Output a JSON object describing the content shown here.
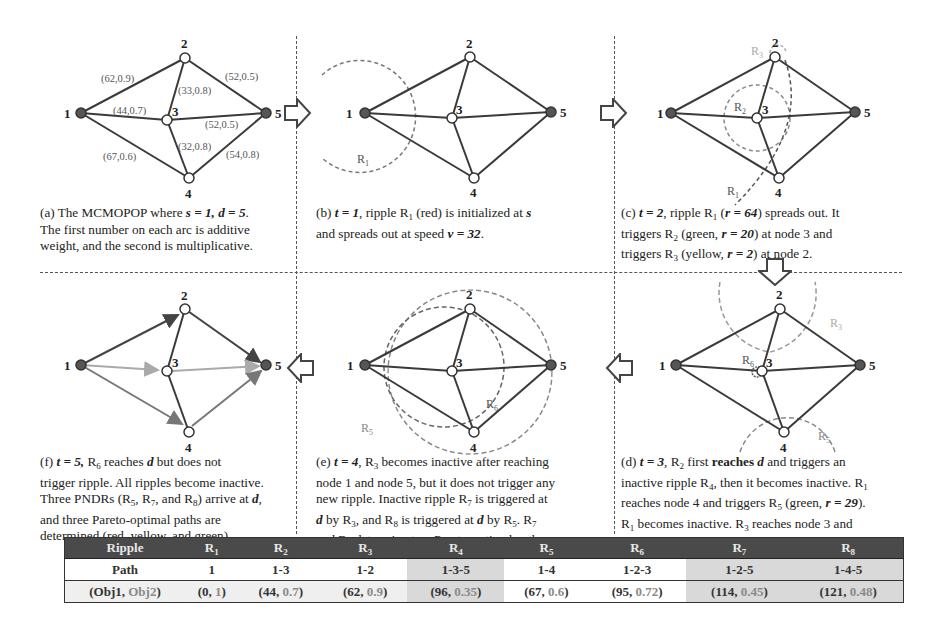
{
  "graph": {
    "nodes": [
      {
        "id": "1",
        "label": "1",
        "role": "source"
      },
      {
        "id": "2",
        "label": "2",
        "role": "intermediate"
      },
      {
        "id": "3",
        "label": "3",
        "role": "intermediate"
      },
      {
        "id": "4",
        "label": "4",
        "role": "intermediate"
      },
      {
        "id": "5",
        "label": "5",
        "role": "destination"
      }
    ],
    "arcs": [
      {
        "from": "1",
        "to": "2",
        "additive": "62",
        "multiplicative": "0.9",
        "label": "(62,0.9)"
      },
      {
        "from": "1",
        "to": "3",
        "additive": "44",
        "multiplicative": "0.7",
        "label": "(44,0.7)"
      },
      {
        "from": "1",
        "to": "4",
        "additive": "67",
        "multiplicative": "0.6",
        "label": "(67,0.6)"
      },
      {
        "from": "2",
        "to": "3",
        "additive": "33",
        "multiplicative": "0.8",
        "label": "(33,0.8)"
      },
      {
        "from": "2",
        "to": "5",
        "additive": "52",
        "multiplicative": "0.5",
        "label": "(52,0.5)"
      },
      {
        "from": "3",
        "to": "5",
        "additive": "52",
        "multiplicative": "0.5",
        "label": "(52,0.5)"
      },
      {
        "from": "3",
        "to": "4",
        "additive": "32",
        "multiplicative": "0.8",
        "label": "(32,0.8)"
      },
      {
        "from": "4",
        "to": "5",
        "additive": "54",
        "multiplicative": "0.8",
        "label": "(54,0.8)"
      }
    ]
  },
  "panels": {
    "a": {
      "caption_lines": [
        "(a) The MCMOPOP where s = 1, d = 5.",
        "The first number on each arc is additive",
        "weight, and the second is multiplicative."
      ],
      "prefix": "(a) The MCMOPOP where ",
      "s_eq": "s = 1, d = 5",
      "line2": "The first number on each arc is additive",
      "line3": "weight, and the second is multiplicative."
    },
    "b": {
      "prefix": "(b) ",
      "t_eq": "t = 1",
      "line1_rest": ", ripple R",
      "line1_sub": "1",
      "line1_tail": " (red) is initialized at ",
      "line1_s": "s",
      "line2_pre": "and spreads out at speed ",
      "line2_v": "v = 32",
      "line2_end": ".",
      "ripple_labels": [
        "R1"
      ]
    },
    "c": {
      "prefix": "(c) ",
      "t_eq": "t = 2",
      "l1a": ", ripple R",
      "l1sub": "1",
      "l1b": " (",
      "l1r": "r = 64",
      "l1c": ") spreads out. It",
      "l2a": "triggers R",
      "l2sub": "2",
      "l2b": " (green, ",
      "l2r": "r = 20",
      "l2c": ") at node 3 and",
      "l3a": "triggers R",
      "l3sub": "3",
      "l3b": " (yellow, ",
      "l3r": "r = 2",
      "l3c": ") at node 2.",
      "ripple_labels": [
        "R1",
        "R2",
        "R3"
      ]
    },
    "d": {
      "prefix": "(d) ",
      "t_eq": "t = 3",
      "l1a": ", R",
      "l1sub": "2",
      "l1b": " first ",
      "l1bold": "reaches ",
      "l1d": "d",
      "l1c": " and triggers an",
      "l2a": "inactive ripple R",
      "l2sub": "4",
      "l2b": ", then it becomes inactive. R",
      "l2sub2": "1",
      "l3a": "reaches node 4 and triggers R",
      "l3sub": "5",
      "l3b": " (green, ",
      "l3r": "r = 29",
      "l3c": ").",
      "l4a": "R",
      "l4sub": "1",
      "l4b": " becomes inactive. R",
      "l4sub2": "3",
      "l4c": " reaches node 3 and",
      "l5a": "triggers R",
      "l5sub": "6",
      "l5b": " (red, ",
      "l5r": "r = 1",
      "l5c": ").",
      "ripple_labels": [
        "R3",
        "R6",
        "R5"
      ]
    },
    "e": {
      "prefix": "(e) ",
      "t_eq": "t = 4",
      "l1a": ", R",
      "l1sub": "3",
      "l1b": " becomes inactive after reaching",
      "l2": "node 1 and node 5, but it does not trigger any",
      "l3a": "new ripple. Inactive ripple R",
      "l3sub": "7",
      "l3b": " is triggered at",
      "l4d": "d",
      "l4a": " by R",
      "l4sub": "3",
      "l4b": ", and R",
      "l4sub2": "8",
      "l4c": " is triggered at ",
      "l4d2": "d",
      "l4e": " by R",
      "l4sub3": "5",
      "l4f": ". R",
      "l4sub4": "7",
      "l5a": "and R",
      "l5sub": "8",
      "l5b": " determine two Pareto-optimal paths.",
      "ripple_labels": [
        "R5",
        "R6"
      ]
    },
    "f": {
      "prefix": "(f) ",
      "t_eq": "t = 5,",
      "l1a": " R",
      "l1sub": "6",
      "l1b": " reaches ",
      "l1d": "d",
      "l1c": " but does not",
      "l2": "trigger ripple. All ripples become inactive.",
      "l3a": "Three PNDRs (R",
      "l3s1": "5",
      "l3b": ", R",
      "l3s2": "7",
      "l3c": ", and R",
      "l3s3": "8",
      "l3d": ") arrive at ",
      "l3dd": "d",
      "l3e": ",",
      "l4": "and three Pareto-optimal paths are",
      "l5": "determined (red, yellow, and green)."
    }
  },
  "table": {
    "header_label": "Ripple",
    "row_path_label": "Path",
    "row_obj_label_a": "(Obj1, ",
    "row_obj_label_b": "Obj2",
    "row_obj_label_c": ")",
    "columns": [
      {
        "ripple": "R",
        "sub": "1",
        "path": "1",
        "obj1": "0",
        "obj2": "1"
      },
      {
        "ripple": "R",
        "sub": "2",
        "path": "1-3",
        "obj1": "44",
        "obj2": "0.7"
      },
      {
        "ripple": "R",
        "sub": "3",
        "path": "1-2",
        "obj1": "62",
        "obj2": "0.9"
      },
      {
        "ripple": "R",
        "sub": "4",
        "path": "1-3-5",
        "obj1": "96",
        "obj2": "0.35"
      },
      {
        "ripple": "R",
        "sub": "5",
        "path": "1-4",
        "obj1": "67",
        "obj2": "0.6"
      },
      {
        "ripple": "R",
        "sub": "6",
        "path": "1-2-3",
        "obj1": "95",
        "obj2": "0.72"
      },
      {
        "ripple": "R",
        "sub": "7",
        "path": "1-2-5",
        "obj1": "114",
        "obj2": "0.45"
      },
      {
        "ripple": "R",
        "sub": "8",
        "path": "1-4-5",
        "obj1": "121",
        "obj2": "0.48"
      }
    ]
  },
  "colors": {
    "header_bg": "#4a4a4a",
    "shade": "#d9d9d9",
    "edge": "#3a3a3a",
    "ripple": "#777777",
    "node_fill_endpoint": "#555555"
  }
}
